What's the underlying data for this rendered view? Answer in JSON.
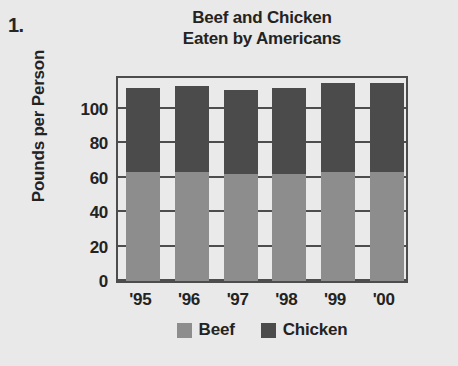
{
  "problem": {
    "number": "1."
  },
  "chart_data": {
    "type": "bar",
    "subtype": "stacked",
    "title": "Beef and Chicken Eaten by Americans",
    "title_lines": [
      "Beef and Chicken",
      "Eaten by Americans"
    ],
    "xlabel": "",
    "ylabel": "Pounds per Person",
    "categories": [
      "'95",
      "'96",
      "'97",
      "'98",
      "'99",
      "'00"
    ],
    "series": [
      {
        "name": "Beef",
        "color": "#8d8d8d",
        "values": [
          63,
          63,
          62,
          62,
          63,
          63
        ]
      },
      {
        "name": "Chicken",
        "color": "#4b4b4b",
        "values": [
          49,
          50,
          49,
          50,
          52,
          52
        ]
      }
    ],
    "totals": [
      112,
      113,
      111,
      112,
      115,
      115
    ],
    "ylim": [
      0,
      120
    ],
    "yticks": [
      0,
      20,
      40,
      60,
      80,
      100
    ],
    "ytick_labels": [
      "0",
      "20",
      "40",
      "60",
      "80",
      "100"
    ],
    "grid": true,
    "legend_position": "bottom"
  },
  "legend": {
    "entries": [
      {
        "label": "Beef",
        "color": "#8d8d8d"
      },
      {
        "label": "Chicken",
        "color": "#4b4b4b"
      }
    ]
  },
  "colors": {
    "background": "#e9e9e9",
    "plot_background": "#eaeaea",
    "axis": "#4d4d4d",
    "text": "#232323",
    "beef": "#8d8d8d",
    "chicken": "#4b4b4b"
  }
}
